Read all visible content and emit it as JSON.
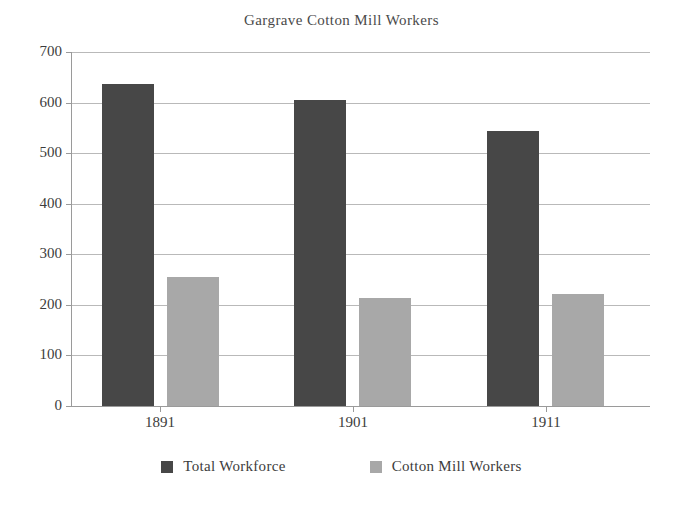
{
  "chart_data": {
    "type": "bar",
    "title": "Gargrave Cotton Mill Workers",
    "xlabel": "",
    "ylabel": "",
    "categories": [
      "1891",
      "1901",
      "1911"
    ],
    "series": [
      {
        "name": "Total Workforce",
        "color": "#474747",
        "values": [
          636,
          606,
          544
        ]
      },
      {
        "name": "Cotton Mill Workers",
        "color": "#a8a8a8",
        "values": [
          255,
          214,
          221
        ]
      }
    ],
    "ylim": [
      0,
      700
    ],
    "yticks": [
      700,
      600,
      500,
      400,
      300,
      200,
      100,
      0
    ],
    "ytick_labels": [
      "700",
      "600",
      "500",
      "400",
      "300",
      "200",
      "100",
      "0"
    ],
    "grid": true,
    "legend_position": "bottom"
  },
  "legend": {
    "items": [
      {
        "label": "Total Workforce",
        "swatch": "total"
      },
      {
        "label": "Cotton Mill Workers",
        "swatch": "cotton"
      }
    ]
  },
  "colors": {
    "total_workforce": "#474747",
    "cotton_mill_workers": "#a8a8a8",
    "gridline": "#b9b9b9",
    "axis": "#9a9a9a",
    "text": "#3c3c3c",
    "background": "#ffffff"
  }
}
